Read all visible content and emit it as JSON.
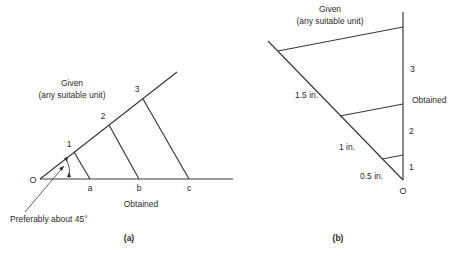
{
  "figure_a": {
    "caption": "(a)",
    "given_label": "Given",
    "given_sublabel": "(any suitable unit)",
    "origin_label": "O",
    "ray_points": [
      "1",
      "2",
      "3"
    ],
    "base_points": [
      "a",
      "b",
      "c"
    ],
    "obtained_label": "Obtained",
    "angle_note": "Preferably about 45°"
  },
  "figure_b": {
    "caption": "(b)",
    "given_label": "Given",
    "given_sublabel": "(any suitable unit)",
    "origin_label": "O",
    "vertical_points": [
      "1",
      "2",
      "3"
    ],
    "obtained_label": "Obtained",
    "slant_labels": [
      "0.5 in.",
      "1 in.",
      "1.5 in."
    ]
  }
}
